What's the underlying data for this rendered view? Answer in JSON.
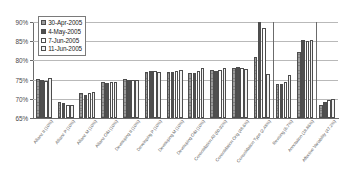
{
  "chart_data": {
    "type": "bar",
    "title": "",
    "xlabel": "",
    "ylabel": "",
    "ylim": [
      65,
      90
    ],
    "ytick_values": [
      65,
      70,
      75,
      80,
      85,
      90
    ],
    "ytick_labels": [
      "65%",
      "70%",
      "75%",
      "80%",
      "85%",
      "90%"
    ],
    "grid": true,
    "legend_position": "top-left",
    "categories": [
      "Allianz II (10%)",
      "Allianz P (10%)",
      "Allianz M (10%)",
      "Allianz O&I (10%)",
      "Developing II (10%)",
      "Developing P (10%)",
      "Developing M (10%)",
      "Developing O&I (10%)",
      "Consolidation All (60.92%)",
      "Consolidation Orig (48.6%)",
      "Consolidation Type (2.48%)",
      "Revising (6.7%)",
      "Annotation (18.86%)",
      "Affective Variability (47.2%)"
    ],
    "series": [
      {
        "name": "30-Apr-2005",
        "color": "#9a9a9a",
        "values": [
          75.2,
          69.1,
          71.4,
          74.3,
          75.1,
          77.0,
          77.0,
          76.7,
          77.4,
          78.0,
          80.8,
          73.9,
          82.2,
          68.5
        ]
      },
      {
        "name": "4-May-2005",
        "color": "#4f4f4f",
        "values": [
          75.0,
          69.0,
          70.9,
          74.2,
          75.0,
          77.2,
          77.0,
          76.6,
          77.2,
          78.2,
          89.9,
          73.9,
          85.2,
          69.2
        ]
      },
      {
        "name": "7-Jun-2005",
        "color": "#ffffff",
        "values": [
          74.6,
          68.5,
          71.6,
          74.3,
          75.0,
          77.3,
          77.2,
          77.2,
          77.4,
          77.9,
          88.5,
          74.5,
          85.1,
          69.6
        ]
      },
      {
        "name": "11-Jun-2005",
        "color": "#f2f2f2",
        "values": [
          75.5,
          68.5,
          71.7,
          74.3,
          75.0,
          77.1,
          77.5,
          77.9,
          78.0,
          77.8,
          76.5,
          76.2,
          85.4,
          70.0
        ]
      }
    ]
  },
  "legend": {
    "items": [
      {
        "label": "30-Apr-2005",
        "swatch": "series-0-swatch"
      },
      {
        "label": "4-May-2005",
        "swatch": "series-1-swatch"
      },
      {
        "label": "7-Jun-2005",
        "swatch": "series-2-swatch"
      },
      {
        "label": "11-Jun-2005",
        "swatch": "series-3-swatch"
      }
    ]
  }
}
